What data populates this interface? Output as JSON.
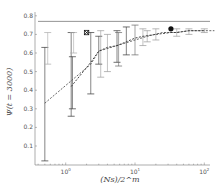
{
  "chart_data": {
    "type": "line",
    "title": "",
    "xlabel": "(Ns)/2^m",
    "ylabel": "Ψ(t = 3000)",
    "xscale": "log",
    "xlim": [
      0.45,
      150
    ],
    "ylim": [
      0.0,
      0.82
    ],
    "x_ticks": [
      {
        "value": 1,
        "label": "10^0"
      },
      {
        "value": 10,
        "label": "10^1"
      },
      {
        "value": 100,
        "label": "10^2"
      }
    ],
    "y_ticks": [
      0.1,
      0.2,
      0.3,
      0.4,
      0.5,
      0.6,
      0.7,
      0.8
    ],
    "grid": false,
    "reference_line": {
      "y": 0.77,
      "style": "solid"
    },
    "series": [
      {
        "name": "dashed series A",
        "style": "dashed",
        "color": "#555555",
        "x": [
          0.5,
          2.3,
          3.0,
          5.5,
          10,
          15,
          25,
          40,
          60,
          100,
          140
        ],
        "y": [
          0.33,
          0.54,
          0.61,
          0.64,
          0.67,
          0.69,
          0.71,
          0.71,
          0.72,
          0.72,
          0.72
        ]
      },
      {
        "name": "dashed series B",
        "style": "dashed",
        "color": "#333333",
        "x": [
          1.2,
          2.3,
          3.0,
          4.0,
          5.5,
          7.5,
          10,
          13,
          20,
          33,
          40,
          60,
          100
        ],
        "y": [
          0.42,
          0.55,
          0.61,
          0.63,
          0.64,
          0.66,
          0.68,
          0.69,
          0.7,
          0.71,
          0.71,
          0.72,
          0.72
        ]
      }
    ],
    "error_bars": [
      {
        "x": 0.5,
        "low": 0.02,
        "high": 0.63,
        "color": "#333333"
      },
      {
        "x": 0.55,
        "low": 0.54,
        "high": 0.71,
        "color": "#aaaaaa"
      },
      {
        "x": 1.2,
        "low": 0.26,
        "high": 0.71,
        "color": "#333333"
      },
      {
        "x": 1.25,
        "low": 0.3,
        "high": 0.58,
        "color": "#333333"
      },
      {
        "x": 1.3,
        "low": 0.6,
        "high": 0.71,
        "color": "#aaaaaa"
      },
      {
        "x": 2.3,
        "low": 0.38,
        "high": 0.71,
        "color": "#333333"
      },
      {
        "x": 3.0,
        "low": 0.54,
        "high": 0.69,
        "color": "#333333"
      },
      {
        "x": 3.2,
        "low": 0.47,
        "high": 0.72,
        "color": "#999999"
      },
      {
        "x": 4.0,
        "low": 0.5,
        "high": 0.7,
        "color": "#999999"
      },
      {
        "x": 5.5,
        "low": 0.55,
        "high": 0.72,
        "color": "#333333"
      },
      {
        "x": 5.8,
        "low": 0.53,
        "high": 0.71,
        "color": "#666666"
      },
      {
        "x": 7.5,
        "low": 0.59,
        "high": 0.74,
        "color": "#333333"
      },
      {
        "x": 10,
        "low": 0.59,
        "high": 0.75,
        "color": "#666666"
      },
      {
        "x": 13,
        "low": 0.64,
        "high": 0.73,
        "color": "#999999"
      },
      {
        "x": 15,
        "low": 0.66,
        "high": 0.72,
        "color": "#999999"
      },
      {
        "x": 20,
        "low": 0.67,
        "high": 0.73,
        "color": "#999999"
      },
      {
        "x": 40,
        "low": 0.69,
        "high": 0.73,
        "color": "#999999"
      },
      {
        "x": 60,
        "low": 0.7,
        "high": 0.73,
        "color": "#999999"
      },
      {
        "x": 100,
        "low": 0.71,
        "high": 0.73,
        "color": "#999999"
      }
    ],
    "markers": [
      {
        "x": 2.0,
        "y": 0.71,
        "shape": "x-square"
      },
      {
        "x": 33,
        "y": 0.73,
        "shape": "filled-circle"
      }
    ]
  }
}
